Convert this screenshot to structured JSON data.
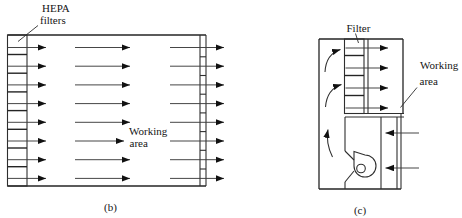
{
  "colors": {
    "background": "#ffffff",
    "line": "#242424",
    "text": "#151515"
  },
  "diagram_b": {
    "filter_label_line1": "HEPA",
    "filter_label_line2": "filters",
    "working_area_line1": "Working",
    "working_area_line2": "area",
    "caption": "(b)"
  },
  "diagram_c": {
    "filter_label": "Filter",
    "working_area_line1": "Working",
    "working_area_line2": "area",
    "caption": "(c)"
  }
}
